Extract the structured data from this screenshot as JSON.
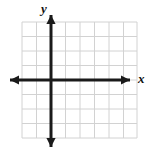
{
  "figure": {
    "kind": "cartesian-coordinate-grid",
    "width": 157,
    "height": 162,
    "background_color": "#ffffff"
  },
  "grid": {
    "line_color": "#d2d2d2",
    "line_width": 1,
    "cell_size": 14.5,
    "left": 22,
    "top": 22,
    "right": 137,
    "bottom": 138,
    "columns": 8,
    "rows": 8,
    "vertical_line_x": [
      22,
      36.5,
      51,
      65.5,
      80,
      94.5,
      109,
      123.5,
      137
    ],
    "horizontal_line_y": [
      22,
      36.5,
      51,
      65.5,
      80,
      94.5,
      109,
      123.5,
      138
    ]
  },
  "axes": {
    "color": "#1a1a1a",
    "line_width": 3,
    "origin_x": 51,
    "origin_y": 80,
    "x_axis": {
      "label": "x",
      "start_x": 10,
      "end_x": 130,
      "y": 80,
      "arrow_left": true,
      "arrow_right": true
    },
    "y_axis": {
      "label": "y",
      "x": 51,
      "start_y": 15,
      "end_y": 147,
      "arrow_up": true,
      "arrow_down": true
    }
  },
  "chart_data": {
    "type": "scatter",
    "title": "",
    "xlabel": "x",
    "ylabel": "y",
    "x": [],
    "y": [],
    "series": [],
    "xlim": [
      -2,
      6
    ],
    "ylim": [
      -4,
      4
    ],
    "grid": true,
    "legend": null,
    "tick_labels": {
      "x": [],
      "y": []
    },
    "annotations": []
  }
}
